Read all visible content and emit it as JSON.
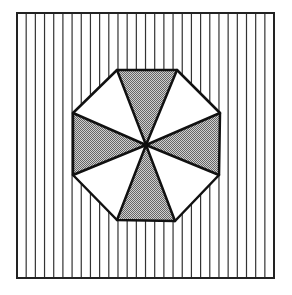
{
  "diagram": {
    "canvas": {
      "width": 292,
      "height": 295,
      "background": "#ffffff"
    },
    "square": {
      "x": 17,
      "y": 13,
      "width": 257,
      "height": 265,
      "stroke": "#222222",
      "stroke_width": 2
    },
    "stripes": {
      "orientation": "vertical",
      "spacing": 9.18,
      "count": 27,
      "color": "#333333",
      "width": 1.2
    },
    "octagon": {
      "center": [
        146,
        145
      ],
      "vertices": [
        [
          117,
          70
        ],
        [
          177,
          70
        ],
        [
          220,
          113
        ],
        [
          219,
          175
        ],
        [
          175,
          221
        ],
        [
          117,
          220
        ],
        [
          73,
          175
        ],
        [
          73,
          113
        ]
      ],
      "stroke": "#111111",
      "stroke_width": 2.5
    },
    "segments": [
      {
        "name": "top",
        "fill": "dotted"
      },
      {
        "name": "top-right",
        "fill": "white"
      },
      {
        "name": "right",
        "fill": "dotted"
      },
      {
        "name": "bottom-right",
        "fill": "white"
      },
      {
        "name": "bottom",
        "fill": "dotted"
      },
      {
        "name": "bottom-left",
        "fill": "white"
      },
      {
        "name": "left",
        "fill": "dotted"
      },
      {
        "name": "top-left",
        "fill": "white"
      }
    ],
    "colors": {
      "dot_light": "#d0d0d0",
      "dot_dark": "#6a6a6a",
      "white": "#ffffff",
      "line": "#111111"
    }
  }
}
